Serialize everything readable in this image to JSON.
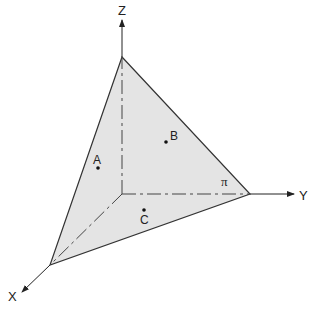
{
  "diagram": {
    "type": "3d-coordinate-plane",
    "axes": {
      "x_label": "X",
      "y_label": "Y",
      "z_label": "Z"
    },
    "plane": {
      "label": "π",
      "fill_color": "#e4e4e4",
      "edge_color": "#333333"
    },
    "points": [
      {
        "label": "A"
      },
      {
        "label": "B"
      },
      {
        "label": "C"
      }
    ],
    "caption": ""
  }
}
